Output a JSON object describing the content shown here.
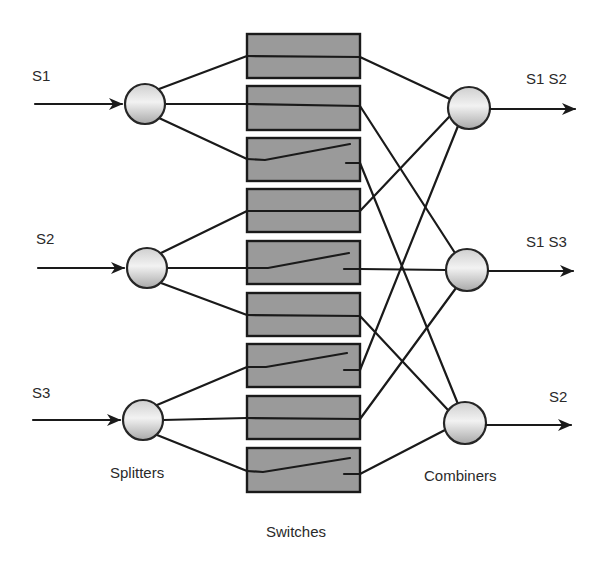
{
  "colors": {
    "line": "#1a1a1a",
    "switch_fill": "#9a9a9a",
    "node_light": "#f4f4f4",
    "node_dark": "#a8a8a8",
    "text": "#2a2a2a"
  },
  "inputs": [
    {
      "id": "S1",
      "label": "S1"
    },
    {
      "id": "S2",
      "label": "S2"
    },
    {
      "id": "S3",
      "label": "S3"
    }
  ],
  "outputs": [
    {
      "id": "out1",
      "label": "S1 S2"
    },
    {
      "id": "out2",
      "label": "S1 S3"
    },
    {
      "id": "out3",
      "label": "S2"
    }
  ],
  "group_labels": {
    "splitters": "Splitters",
    "switches": "Switches",
    "combiners": "Combiners"
  },
  "switches": [
    {
      "index": 1,
      "from_splitter": "S1",
      "to_combiner": "out1",
      "state": "closed"
    },
    {
      "index": 2,
      "from_splitter": "S1",
      "to_combiner": "out2",
      "state": "closed"
    },
    {
      "index": 3,
      "from_splitter": "S1",
      "to_combiner": "out3",
      "state": "open"
    },
    {
      "index": 4,
      "from_splitter": "S2",
      "to_combiner": "out1",
      "state": "closed"
    },
    {
      "index": 5,
      "from_splitter": "S2",
      "to_combiner": "out2",
      "state": "open"
    },
    {
      "index": 6,
      "from_splitter": "S2",
      "to_combiner": "out3",
      "state": "closed"
    },
    {
      "index": 7,
      "from_splitter": "S3",
      "to_combiner": "out1",
      "state": "open"
    },
    {
      "index": 8,
      "from_splitter": "S3",
      "to_combiner": "out2",
      "state": "closed"
    },
    {
      "index": 9,
      "from_splitter": "S3",
      "to_combiner": "out3",
      "state": "open"
    }
  ]
}
